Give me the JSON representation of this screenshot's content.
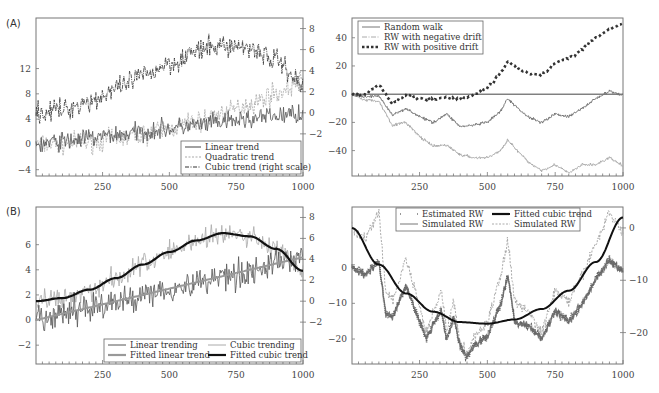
{
  "chart_data": [
    {
      "panel": "A-left",
      "type": "line",
      "panel_label": "(A)",
      "title": "",
      "xlabel": "",
      "ylabel": "",
      "xlim": [
        1,
        1000
      ],
      "x_ticks": [
        250,
        500,
        750,
        1000
      ],
      "ylim_left": [
        -5,
        20
      ],
      "y_ticks_left": [
        -4,
        0,
        4,
        8,
        12
      ],
      "ylim_right": [
        -6,
        9
      ],
      "y_ticks_right": [
        -2,
        0,
        2,
        4,
        6,
        8
      ],
      "legend_position": "lower right",
      "series": [
        {
          "name": "Linear trend",
          "style": "solid",
          "color": "#555555",
          "axis": "left",
          "x": [
            0,
            100,
            200,
            300,
            400,
            500,
            600,
            700,
            800,
            900,
            1000
          ],
          "values": [
            0,
            0.5,
            1,
            1.5,
            2,
            2.5,
            3,
            3.5,
            4,
            4.5,
            5
          ]
        },
        {
          "name": "Quadratic trend",
          "style": "dashed",
          "color": "#aaaaaa",
          "axis": "left",
          "x": [
            0,
            100,
            200,
            300,
            400,
            500,
            600,
            700,
            800,
            900,
            1000
          ],
          "values": [
            0,
            0.1,
            0.4,
            0.9,
            1.6,
            2.5,
            3.6,
            4.9,
            6.4,
            8.1,
            10
          ]
        },
        {
          "name": "Cubic trend (right scale)",
          "style": "dashdot",
          "color": "#333333",
          "axis": "right",
          "x": [
            0,
            100,
            200,
            300,
            400,
            500,
            600,
            700,
            800,
            900,
            1000
          ],
          "values": [
            0,
            0.3,
            1.1,
            2.2,
            3.5,
            4.7,
            5.8,
            6.4,
            6.2,
            5.0,
            2.7
          ]
        }
      ],
      "legend": [
        "Linear trend",
        "Quadratic trend",
        "Cubic trend (right scale)"
      ]
    },
    {
      "panel": "A-right",
      "type": "line",
      "title": "",
      "xlim": [
        1,
        1000
      ],
      "x_ticks": [
        250,
        500,
        750,
        1000
      ],
      "ylim": [
        -58,
        54
      ],
      "y_ticks": [
        -40,
        -20,
        0,
        20,
        40
      ],
      "reference_line": 0,
      "legend_position": "upper left",
      "series": [
        {
          "name": "Random walk",
          "style": "solid",
          "color": "#777777",
          "x": [
            0,
            50,
            100,
            150,
            200,
            250,
            300,
            350,
            400,
            450,
            500,
            550,
            575,
            600,
            650,
            700,
            750,
            800,
            850,
            900,
            950,
            1000
          ],
          "values": [
            0,
            -2,
            -1,
            -15,
            -10,
            -16,
            -20,
            -14,
            -23,
            -22,
            -20,
            -12,
            -3,
            -8,
            -16,
            -20,
            -14,
            -16,
            -10,
            -3,
            2,
            -1
          ]
        },
        {
          "name": "RW with negative drift",
          "style": "dashdot",
          "color": "#aaaaaa",
          "x": [
            0,
            50,
            100,
            150,
            200,
            250,
            300,
            350,
            400,
            450,
            500,
            550,
            575,
            600,
            650,
            700,
            750,
            800,
            850,
            900,
            950,
            1000
          ],
          "values": [
            0,
            -4,
            -5,
            -22,
            -20,
            -30,
            -37,
            -36,
            -43,
            -45,
            -45,
            -40,
            -32,
            -38,
            -48,
            -54,
            -50,
            -56,
            -50,
            -50,
            -45,
            -51
          ]
        },
        {
          "name": "RW with positive drift",
          "style": "dotted-bold",
          "color": "#333333",
          "x": [
            0,
            50,
            100,
            150,
            200,
            250,
            300,
            350,
            400,
            450,
            500,
            550,
            575,
            600,
            650,
            700,
            750,
            800,
            850,
            900,
            950,
            1000
          ],
          "values": [
            0,
            0,
            7,
            -7,
            0,
            -3,
            -4,
            -2,
            -4,
            0,
            4,
            15,
            24,
            20,
            15,
            14,
            22,
            25,
            32,
            40,
            46,
            50
          ]
        }
      ],
      "legend": [
        "Random walk",
        "RW with negative drift",
        "RW with positive drift"
      ]
    },
    {
      "panel": "B-left",
      "type": "line",
      "panel_label": "(B)",
      "xlim": [
        1,
        1000
      ],
      "x_ticks": [
        250,
        500,
        750,
        1000
      ],
      "ylim_left": [
        -3.5,
        9
      ],
      "y_ticks_left": [
        -2,
        0,
        2,
        4,
        6
      ],
      "ylim_right": [
        -6,
        9
      ],
      "y_ticks_right": [
        -2,
        0,
        2,
        4,
        6,
        8
      ],
      "legend_position": "lower right",
      "series": [
        {
          "name": "Linear trending",
          "style": "solid",
          "color": "#555555",
          "axis": "left",
          "x": [
            0,
            250,
            500,
            750,
            1000
          ],
          "values": [
            0,
            1.2,
            2.5,
            3.7,
            5
          ]
        },
        {
          "name": "Cubic trending",
          "style": "solid",
          "color": "#aaaaaa",
          "axis": "right",
          "x": [
            0,
            100,
            200,
            300,
            400,
            500,
            600,
            700,
            800,
            900,
            1000
          ],
          "values": [
            0,
            0.3,
            1.1,
            2.2,
            3.5,
            4.7,
            5.8,
            6.4,
            6.2,
            5.0,
            2.7
          ]
        },
        {
          "name": "Fitted linear trend",
          "style": "solid-thick",
          "color": "#999999",
          "axis": "left",
          "x": [
            0,
            1000
          ],
          "values": [
            0,
            5
          ]
        },
        {
          "name": "Fitted cubic trend",
          "style": "solid-thick",
          "color": "#111111",
          "axis": "right",
          "x": [
            0,
            100,
            200,
            300,
            400,
            500,
            600,
            700,
            800,
            900,
            1000
          ],
          "values": [
            0,
            0.3,
            1.1,
            2.2,
            3.5,
            4.7,
            5.8,
            6.5,
            6.2,
            5.0,
            2.9
          ]
        }
      ],
      "legend": [
        "Linear trending",
        "Cubic trending",
        "Fitted linear trend",
        "Fitted cubic trend"
      ]
    },
    {
      "panel": "B-right",
      "type": "line",
      "xlim": [
        1,
        1000
      ],
      "x_ticks": [
        250,
        500,
        750,
        1000
      ],
      "ylim_left": [
        -27,
        17
      ],
      "y_ticks_left": [
        -20,
        -10,
        0
      ],
      "ylim_right": [
        -26,
        4
      ],
      "y_ticks_right": [
        -20,
        -10,
        0
      ],
      "legend_position": "upper center",
      "series": [
        {
          "name": "Estimated RW",
          "style": "dots",
          "color": "#777777",
          "axis": "left",
          "x": [
            0,
            50,
            100,
            125,
            150,
            200,
            250,
            275,
            300,
            330,
            350,
            375,
            400,
            425,
            450,
            500,
            550,
            575,
            600,
            650,
            700,
            750,
            800,
            850,
            900,
            950,
            1000
          ],
          "values": [
            0,
            -2,
            2,
            -13,
            -14,
            -5,
            -15,
            -20,
            -16,
            -12,
            -20,
            -14,
            -22,
            -25,
            -22,
            -19,
            -10,
            -2,
            -15,
            -16,
            -20,
            -12,
            -15,
            -10,
            -3,
            2,
            -1
          ]
        },
        {
          "name": "Fitted cubic trend",
          "style": "solid-thick",
          "color": "#111111",
          "axis": "right",
          "x": [
            0,
            100,
            200,
            300,
            400,
            500,
            600,
            700,
            800,
            900,
            1000
          ],
          "values": [
            0,
            -7,
            -12.5,
            -16,
            -18,
            -18.3,
            -17.5,
            -15.5,
            -12,
            -6.5,
            2
          ]
        },
        {
          "name": "Simulated RW",
          "style": "solid",
          "color": "#777777",
          "axis": "left",
          "x": [
            0,
            50,
            100,
            125,
            150,
            200,
            250,
            275,
            300,
            330,
            350,
            375,
            400,
            425,
            450,
            500,
            550,
            575,
            600,
            650,
            700,
            750,
            800,
            850,
            900,
            950,
            1000
          ],
          "values": [
            0,
            -2,
            2,
            -13,
            -14,
            -5,
            -15,
            -20,
            -16,
            -12,
            -20,
            -14,
            -22,
            -25,
            -22,
            -19,
            -10,
            -2,
            -15,
            -16,
            -20,
            -12,
            -15,
            -10,
            -3,
            2,
            -1
          ]
        },
        {
          "name": "Simulated RW",
          "style": "dashed",
          "color": "#aaaaaa",
          "axis": "right",
          "x": [
            0,
            50,
            100,
            125,
            150,
            200,
            250,
            275,
            300,
            330,
            350,
            375,
            400,
            425,
            450,
            500,
            550,
            575,
            600,
            650,
            700,
            750,
            800,
            850,
            900,
            950,
            1000
          ],
          "values": [
            0,
            -2,
            3,
            -12,
            -14,
            -6,
            -15,
            -20,
            -16,
            -12,
            -20,
            -14,
            -22,
            -24,
            -21,
            -18,
            -9,
            -2,
            -14,
            -16,
            -20,
            -12,
            -14,
            -9,
            -3,
            3,
            -1
          ]
        }
      ],
      "legend": [
        "Estimated RW",
        "Fitted cubic trend",
        "Simulated RW",
        "Simulated RW"
      ]
    }
  ],
  "labels": {
    "panel_a": "(A)",
    "panel_b": "(B)"
  }
}
